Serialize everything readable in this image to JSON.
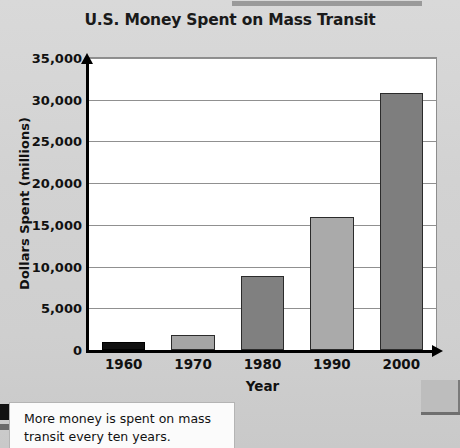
{
  "chart_data": {
    "type": "bar",
    "title": "U.S. Money Spent on Mass Transit",
    "xlabel": "Year",
    "ylabel": "Dollars Spent (millions)",
    "categories": [
      "1960",
      "1970",
      "1980",
      "1990",
      "2000"
    ],
    "values": [
      1000,
      1800,
      8900,
      16000,
      30800
    ],
    "bar_colors": [
      "#111111",
      "#a5a5a5",
      "#808080",
      "#aaaaaa",
      "#7e7e7e"
    ],
    "ylim": [
      0,
      35000
    ],
    "ytick_labels": [
      "0",
      "5,000",
      "10,000",
      "15,000",
      "20,000",
      "25,000",
      "30,000",
      "35,000"
    ],
    "ytick_values": [
      0,
      5000,
      10000,
      15000,
      20000,
      25000,
      30000,
      35000
    ],
    "grid": true,
    "legend": null
  },
  "caption": {
    "text": "More money is spent on mass transit every ten years."
  },
  "colors": {
    "page_background": "#d4d4d4",
    "plot_background": "#ffffff",
    "axis": "#000000",
    "gridline": "#909090",
    "text": "#111111"
  }
}
